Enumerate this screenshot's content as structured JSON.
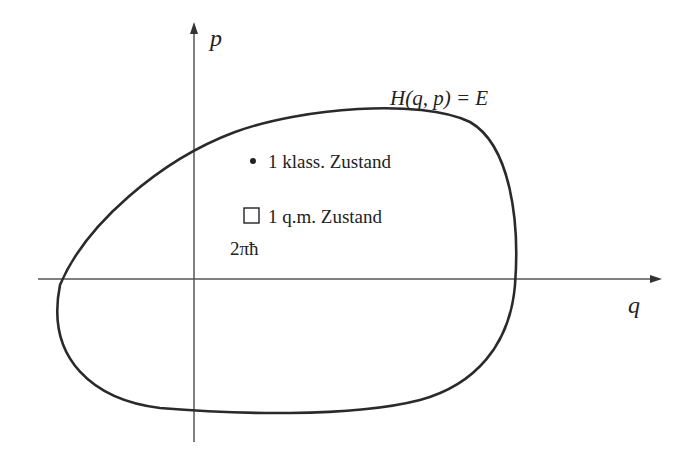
{
  "diagram": {
    "type": "phase-space",
    "axes": {
      "horizontal_label": "q",
      "vertical_label": "p"
    },
    "curve_label": "H(q, p) = E",
    "annotations": [
      {
        "marker": "dot",
        "text": "1 klass. Zustand"
      },
      {
        "marker": "square",
        "text": "1 q.m. Zustand"
      },
      {
        "marker": "none",
        "text": "2πħ"
      }
    ],
    "colors": {
      "curve": "#2a2a2a",
      "axes": "#555555",
      "text": "#222222"
    }
  }
}
